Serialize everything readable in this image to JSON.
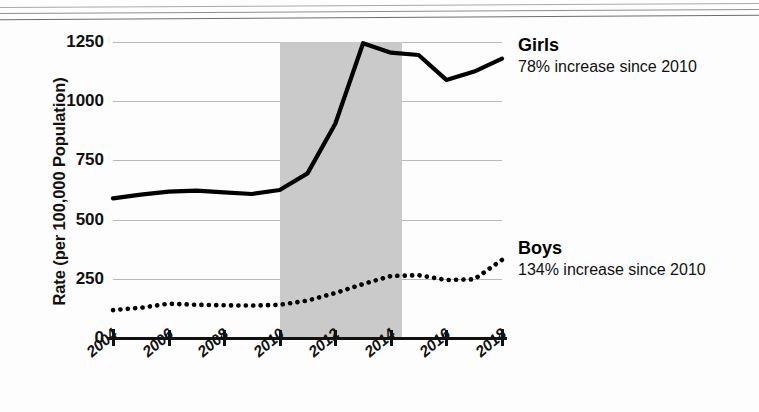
{
  "chart_data": {
    "type": "line",
    "title": "",
    "xlabel": "",
    "ylabel": "Rate (per 100,000 Population)",
    "x": [
      2004,
      2005,
      2006,
      2007,
      2008,
      2009,
      2010,
      2011,
      2012,
      2013,
      2014,
      2015,
      2016,
      2017,
      2018
    ],
    "xlim": [
      2004,
      2018
    ],
    "ylim": [
      0,
      1250
    ],
    "yticks": [
      0,
      250,
      500,
      750,
      1000,
      1250
    ],
    "ytick_labels": [
      "0",
      "250",
      "500",
      "750",
      "1000",
      "1250"
    ],
    "xticks": [
      2004,
      2006,
      2008,
      2010,
      2012,
      2014,
      2016,
      2018
    ],
    "xtick_labels": [
      "2004",
      "2006",
      "2008",
      "2010",
      "2012",
      "2014",
      "2016",
      "2018"
    ],
    "grid": true,
    "legend": "inline-right-labels",
    "shaded_region": {
      "x_start": 2010,
      "x_end": 2014.4,
      "color": "#cacaca",
      "label": ""
    },
    "series": [
      {
        "name": "Girls",
        "style": "solid",
        "color": "#000000",
        "annotation_title": "Girls",
        "annotation_sub": "78% increase since 2010",
        "values": [
          590,
          605,
          618,
          622,
          615,
          608,
          625,
          695,
          905,
          1245,
          1205,
          1195,
          1090,
          1125,
          1180
        ]
      },
      {
        "name": "Boys",
        "style": "dotted",
        "color": "#000000",
        "annotation_title": "Boys",
        "annotation_sub": "134% increase since 2010",
        "values": [
          118,
          128,
          145,
          140,
          138,
          137,
          140,
          158,
          190,
          228,
          262,
          265,
          245,
          248,
          330
        ]
      }
    ]
  },
  "axis": {
    "y_title": "Rate (per 100,000 Population)"
  }
}
